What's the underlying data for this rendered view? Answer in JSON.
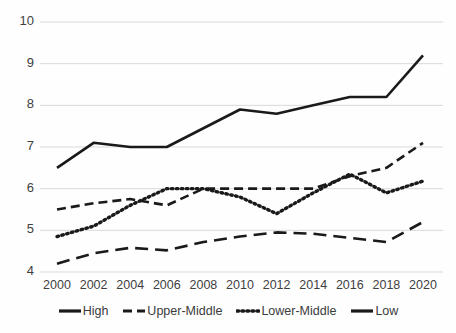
{
  "chart_data": {
    "type": "line",
    "title": "",
    "subtitle": "",
    "xlabel": "",
    "ylabel": "",
    "categories": [
      2000,
      2002,
      2004,
      2006,
      2008,
      2010,
      2012,
      2014,
      2016,
      2018,
      2020
    ],
    "x_tick_labels": [
      "2000",
      "2002",
      "2004",
      "2006",
      "2008",
      "2010",
      "2012",
      "2014",
      "2016",
      "2018",
      "2020"
    ],
    "y_tick_labels": [
      "10",
      "9",
      "8",
      "7",
      "6",
      "5",
      "4"
    ],
    "y_ticks": [
      10,
      9,
      8,
      7,
      6,
      5,
      4
    ],
    "xlim": [
      2000,
      2020
    ],
    "ylim": [
      4,
      10
    ],
    "grid": "horizontal",
    "legend_position": "bottom",
    "series": [
      {
        "name": "High",
        "style": "solid",
        "color": "#1a1a1a",
        "values": [
          6.5,
          7.1,
          7.0,
          7.0,
          7.45,
          7.9,
          7.8,
          8.0,
          8.2,
          8.2,
          9.2
        ]
      },
      {
        "name": "Upper-Middle",
        "style": "dashed",
        "color": "#1a1a1a",
        "values": [
          5.5,
          5.65,
          5.75,
          5.6,
          6.0,
          6.0,
          6.0,
          6.0,
          6.3,
          6.5,
          7.1
        ]
      },
      {
        "name": "Lower-Middle",
        "style": "dotted",
        "color": "#1a1a1a",
        "values": [
          4.85,
          5.1,
          5.6,
          6.0,
          6.0,
          5.8,
          5.4,
          5.9,
          6.35,
          5.9,
          6.18
        ]
      },
      {
        "name": "Low",
        "style": "long-dash",
        "color": "#1a1a1a",
        "values": [
          4.2,
          4.45,
          4.58,
          4.52,
          4.72,
          4.85,
          4.95,
          4.92,
          4.82,
          4.72,
          5.2
        ]
      }
    ]
  },
  "legend": {
    "items": [
      {
        "label": "High",
        "swatch": "solid-line-swatch"
      },
      {
        "label": "Upper-Middle",
        "swatch": "dashed-line-swatch"
      },
      {
        "label": "Lower-Middle",
        "swatch": "dotted-line-swatch"
      },
      {
        "label": "Low",
        "swatch": "solid-line-swatch"
      }
    ]
  }
}
